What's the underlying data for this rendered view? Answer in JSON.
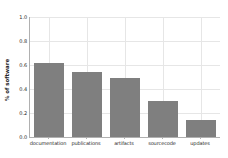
{
  "chart_data": {
    "type": "bar",
    "title": "",
    "xlabel": "",
    "ylabel": "% of software",
    "categories": [
      "documentation",
      "publications",
      "artifacts",
      "sourcecode",
      "updates"
    ],
    "values": [
      0.62,
      0.54,
      0.49,
      0.3,
      0.14
    ],
    "ylim": [
      0.0,
      1.0
    ],
    "ytick_labels": [
      "0.0",
      "0.2",
      "0.4",
      "0.6",
      "0.8",
      "1.0"
    ],
    "ytick_values": [
      0.0,
      0.2,
      0.4,
      0.6,
      0.8,
      1.0
    ],
    "grid": true,
    "legend": null,
    "bar_color": "#7f7f7f",
    "grid_color": "#e6e6e6",
    "axis_color": "#b0b0b0",
    "background": "#ffffff"
  }
}
